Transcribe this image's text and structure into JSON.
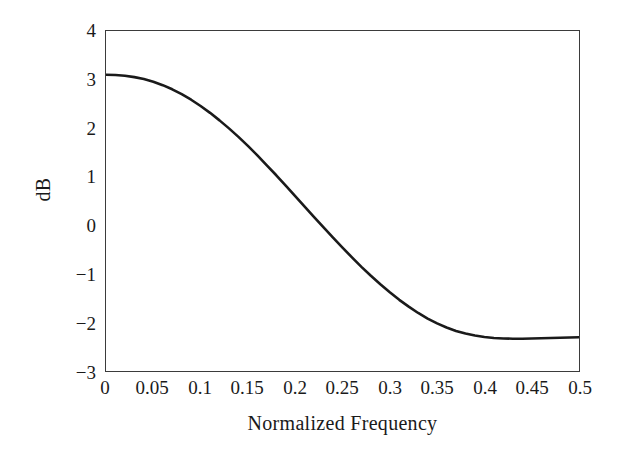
{
  "chart_data": {
    "type": "line",
    "title": "",
    "xlabel": "Normalized Frequency",
    "ylabel": "dB",
    "xlim": [
      0,
      0.5
    ],
    "ylim": [
      -3,
      4
    ],
    "grid": false,
    "legend": null,
    "xticks": [
      "0",
      "0.05",
      "0.1",
      "0.15",
      "0.2",
      "0.25",
      "0.3",
      "0.35",
      "0.4",
      "0.45",
      "0.5"
    ],
    "xtick_values": [
      0,
      0.05,
      0.1,
      0.15,
      0.2,
      0.25,
      0.3,
      0.35,
      0.4,
      0.45,
      0.5
    ],
    "yticks": [
      "4",
      "3",
      "2",
      "1",
      "0",
      "−1",
      "−2",
      "−3"
    ],
    "ytick_values": [
      4,
      3,
      2,
      1,
      0,
      -1,
      -2,
      -3
    ],
    "series": [
      {
        "name": "magnitude response",
        "color": "#1a1a1a",
        "linewidth": 2.6,
        "x": [
          0.0,
          0.01,
          0.02,
          0.03,
          0.04,
          0.05,
          0.06,
          0.07,
          0.08,
          0.09,
          0.1,
          0.11,
          0.12,
          0.13,
          0.14,
          0.15,
          0.16,
          0.17,
          0.18,
          0.19,
          0.2,
          0.21,
          0.22,
          0.23,
          0.24,
          0.25,
          0.26,
          0.27,
          0.28,
          0.29,
          0.3,
          0.31,
          0.32,
          0.33,
          0.34,
          0.35,
          0.36,
          0.37,
          0.38,
          0.39,
          0.4,
          0.41,
          0.42,
          0.43,
          0.44,
          0.45,
          0.46,
          0.47,
          0.48,
          0.49,
          0.5
        ],
        "y": [
          3.1,
          3.095,
          3.08,
          3.05,
          3.01,
          2.955,
          2.885,
          2.8,
          2.7,
          2.585,
          2.455,
          2.315,
          2.16,
          1.995,
          1.82,
          1.635,
          1.44,
          1.235,
          1.03,
          0.815,
          0.6,
          0.385,
          0.17,
          -0.045,
          -0.255,
          -0.46,
          -0.66,
          -0.855,
          -1.04,
          -1.215,
          -1.38,
          -1.535,
          -1.675,
          -1.805,
          -1.92,
          -2.02,
          -2.105,
          -2.175,
          -2.23,
          -2.27,
          -2.3,
          -2.32,
          -2.33,
          -2.335,
          -2.335,
          -2.33,
          -2.325,
          -2.32,
          -2.315,
          -2.31,
          -2.305
        ]
      }
    ],
    "annotations": []
  },
  "axes": {
    "x_title": "Normalized Frequency",
    "y_title": "dB"
  }
}
